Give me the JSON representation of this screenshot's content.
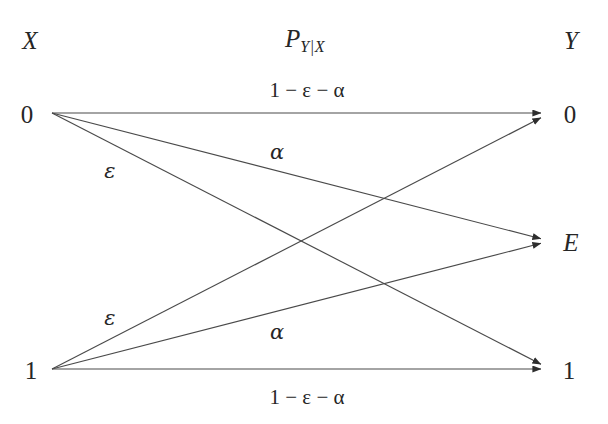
{
  "figure": {
    "type": "channel-transition-diagram",
    "background_color": "#ffffff",
    "line_color": "#3a3a3a",
    "text_color": "#262626",
    "headers": {
      "input_label": "X",
      "output_label": "Y",
      "channel_label_base": "P",
      "channel_label_sub": "Y|X",
      "channel_label_full": "P_Y|X"
    },
    "input_nodes": [
      {
        "id": "x0",
        "label": "0",
        "x": 52,
        "y": 113,
        "label_x": 27,
        "label_y": 114
      },
      {
        "id": "x1",
        "label": "1",
        "x": 52,
        "y": 369,
        "label_x": 31,
        "label_y": 370
      }
    ],
    "output_nodes": [
      {
        "id": "y0",
        "label": "0",
        "x": 550,
        "y": 113,
        "label_x": 570,
        "label_y": 114
      },
      {
        "id": "yE",
        "label": "E",
        "x": 550,
        "y": 241,
        "label_x": 571,
        "label_y": 242
      },
      {
        "id": "y1",
        "label": "1",
        "x": 550,
        "y": 369,
        "label_x": 569,
        "label_y": 370
      }
    ],
    "edges": [
      {
        "id": "x0-y0",
        "from": "x0",
        "to": "y0",
        "label": "1 − ε − α",
        "label_x": 307,
        "label_y": 90
      },
      {
        "id": "x0-yE",
        "from": "x0",
        "to": "yE",
        "label": "ε",
        "label_x": 110,
        "label_y": 171
      },
      {
        "id": "x0-y1",
        "from": "x0",
        "to": "y1",
        "label": "α",
        "label_x": 277,
        "label_y": 152
      },
      {
        "id": "x1-y0",
        "from": "x1",
        "to": "y0",
        "label": "α",
        "label_x": 277,
        "label_y": 332
      },
      {
        "id": "x1-yE",
        "from": "x1",
        "to": "yE",
        "label": "ε",
        "label_x": 110,
        "label_y": 318
      },
      {
        "id": "x1-y1",
        "from": "x1",
        "to": "y1",
        "label": "1 − ε − α",
        "label_x": 307,
        "label_y": 397
      }
    ],
    "header_positions": {
      "input_x": 30,
      "input_y": 40,
      "channel_x": 305,
      "channel_y": 38,
      "output_x": 571,
      "output_y": 40
    },
    "edge_label_parts": {
      "one": "1",
      "minus": "−",
      "epsilon": "ε",
      "alpha": "α"
    }
  }
}
